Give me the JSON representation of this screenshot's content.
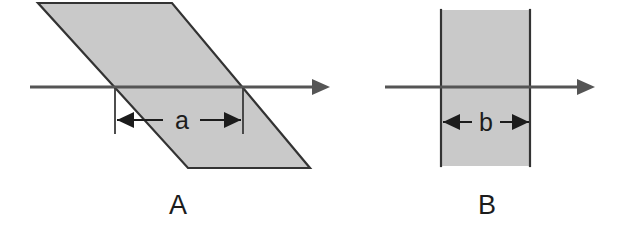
{
  "figure": {
    "background_color": "#ffffff",
    "slab_fill_color": "#c9c9c9",
    "slab_outline_color": "#333333",
    "ray_color": "#555555",
    "dimension_color": "#1c1c1c"
  },
  "panels": [
    {
      "id": "A",
      "panel_label": "A",
      "panel_label_x": 178,
      "panel_label_y": 214,
      "shape": "tilted-parallelogram-slab",
      "shape_points": "38,3 172,3 310,168 188,168",
      "ray": {
        "label": "incident-ray",
        "x1": 30,
        "y1": 87,
        "x2": 312,
        "y2": 87,
        "head": "312,79 330,87 312,95"
      },
      "dimension": {
        "symbol": "a",
        "symbol_x": 182,
        "symbol_y": 129,
        "tick_left_x": 115,
        "tick_right_x": 243,
        "tick_top_y": 88,
        "tick_bottom_y": 134,
        "arrow_y": 120,
        "left_head": "117,120 134,112 134,128",
        "right_head": "241,120 224,112 224,128",
        "left_line_x1": 117,
        "left_line_x2": 163,
        "right_line_x1": 200,
        "right_line_x2": 241
      }
    },
    {
      "id": "B",
      "panel_label": "B",
      "panel_label_x": 487,
      "panel_label_y": 214,
      "shape": "upright-rectangular-slab",
      "shape_points": "440,10 531,10 531,166 440,166",
      "edge_left": {
        "x": 441,
        "y1": 10,
        "y2": 166
      },
      "edge_right": {
        "x": 530,
        "y1": 10,
        "y2": 166
      },
      "ray": {
        "label": "incident-ray",
        "x1": 385,
        "y1": 87,
        "x2": 577,
        "y2": 87,
        "head": "577,79 595,87 577,95"
      },
      "dimension": {
        "symbol": "b",
        "symbol_x": 486,
        "symbol_y": 131,
        "arrow_y": 122,
        "left_head": "443,122 460,114 460,130",
        "right_head": "529,122 512,114 512,130",
        "left_line_x1": 443,
        "left_line_x2": 472,
        "right_line_x1": 500,
        "right_line_x2": 529
      }
    }
  ]
}
